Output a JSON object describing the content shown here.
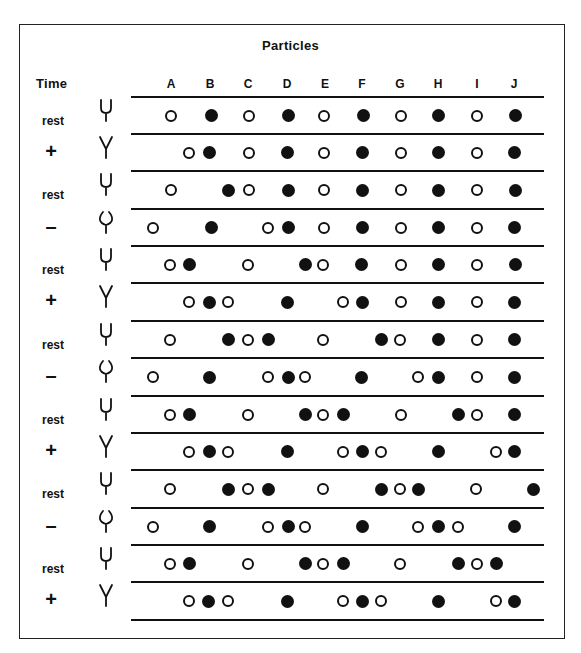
{
  "title": "Particles",
  "time_header": "Time",
  "columns": [
    "A",
    "B",
    "C",
    "D",
    "E",
    "F",
    "G",
    "H",
    "I",
    "J"
  ],
  "column_x": [
    171,
    210,
    248,
    287,
    325,
    362,
    400,
    438,
    477,
    514
  ],
  "line_y": [
    97,
    134,
    171,
    209,
    246,
    283,
    321,
    358,
    396,
    433,
    470,
    508,
    545,
    582,
    620
  ],
  "rows": [
    {
      "label": "rest",
      "fork": "rest",
      "dots": [
        [
          171,
          "o"
        ],
        [
          211,
          "f"
        ],
        [
          249,
          "o"
        ],
        [
          288,
          "f"
        ],
        [
          324,
          "o"
        ],
        [
          363,
          "f"
        ],
        [
          401,
          "o"
        ],
        [
          438,
          "f"
        ],
        [
          477,
          "o"
        ],
        [
          515,
          "f"
        ]
      ]
    },
    {
      "label": "+",
      "fork": "plus",
      "dots": [
        [
          189,
          "o"
        ],
        [
          209,
          "f"
        ],
        [
          249,
          "o"
        ],
        [
          287,
          "f"
        ],
        [
          324,
          "o"
        ],
        [
          362,
          "f"
        ],
        [
          401,
          "o"
        ],
        [
          438,
          "f"
        ],
        [
          477,
          "o"
        ],
        [
          514,
          "f"
        ]
      ]
    },
    {
      "label": "rest",
      "fork": "rest",
      "dots": [
        [
          171,
          "o"
        ],
        [
          228,
          "f"
        ],
        [
          249,
          "o"
        ],
        [
          288,
          "f"
        ],
        [
          324,
          "o"
        ],
        [
          362,
          "f"
        ],
        [
          401,
          "o"
        ],
        [
          438,
          "f"
        ],
        [
          477,
          "o"
        ],
        [
          515,
          "f"
        ]
      ]
    },
    {
      "label": "–",
      "fork": "minus",
      "dots": [
        [
          153,
          "o"
        ],
        [
          211,
          "f"
        ],
        [
          268,
          "o"
        ],
        [
          288,
          "f"
        ],
        [
          324,
          "o"
        ],
        [
          362,
          "f"
        ],
        [
          401,
          "o"
        ],
        [
          438,
          "f"
        ],
        [
          477,
          "o"
        ],
        [
          514,
          "f"
        ]
      ]
    },
    {
      "label": "rest",
      "fork": "rest",
      "dots": [
        [
          170,
          "o"
        ],
        [
          189,
          "f"
        ],
        [
          248,
          "o"
        ],
        [
          305,
          "f"
        ],
        [
          323,
          "o"
        ],
        [
          361,
          "f"
        ],
        [
          401,
          "o"
        ],
        [
          438,
          "f"
        ],
        [
          477,
          "o"
        ],
        [
          515,
          "f"
        ]
      ]
    },
    {
      "label": "+",
      "fork": "plus",
      "dots": [
        [
          189,
          "o"
        ],
        [
          209,
          "f"
        ],
        [
          228,
          "o"
        ],
        [
          287,
          "f"
        ],
        [
          343,
          "o"
        ],
        [
          362,
          "f"
        ],
        [
          401,
          "o"
        ],
        [
          438,
          "f"
        ],
        [
          477,
          "o"
        ],
        [
          514,
          "f"
        ]
      ]
    },
    {
      "label": "rest",
      "fork": "rest",
      "dots": [
        [
          170,
          "o"
        ],
        [
          228,
          "f"
        ],
        [
          248,
          "o"
        ],
        [
          268,
          "f"
        ],
        [
          323,
          "o"
        ],
        [
          381,
          "f"
        ],
        [
          400,
          "o"
        ],
        [
          438,
          "f"
        ],
        [
          477,
          "o"
        ],
        [
          514,
          "f"
        ]
      ]
    },
    {
      "label": "–",
      "fork": "minus",
      "dots": [
        [
          153,
          "o"
        ],
        [
          209,
          "f"
        ],
        [
          268,
          "o"
        ],
        [
          288,
          "f"
        ],
        [
          305,
          "o"
        ],
        [
          361,
          "f"
        ],
        [
          418,
          "o"
        ],
        [
          438,
          "f"
        ],
        [
          477,
          "o"
        ],
        [
          514,
          "f"
        ]
      ]
    },
    {
      "label": "rest",
      "fork": "rest",
      "dots": [
        [
          170,
          "o"
        ],
        [
          189,
          "f"
        ],
        [
          248,
          "o"
        ],
        [
          305,
          "f"
        ],
        [
          323,
          "o"
        ],
        [
          343,
          "f"
        ],
        [
          401,
          "o"
        ],
        [
          458,
          "f"
        ],
        [
          477,
          "o"
        ],
        [
          514,
          "f"
        ]
      ]
    },
    {
      "label": "+",
      "fork": "plus",
      "dots": [
        [
          189,
          "o"
        ],
        [
          209,
          "f"
        ],
        [
          228,
          "o"
        ],
        [
          287,
          "f"
        ],
        [
          343,
          "o"
        ],
        [
          362,
          "f"
        ],
        [
          381,
          "o"
        ],
        [
          438,
          "f"
        ],
        [
          496,
          "o"
        ],
        [
          514,
          "f"
        ]
      ]
    },
    {
      "label": "rest",
      "fork": "rest",
      "dots": [
        [
          170,
          "o"
        ],
        [
          228,
          "f"
        ],
        [
          248,
          "o"
        ],
        [
          268,
          "f"
        ],
        [
          323,
          "o"
        ],
        [
          381,
          "f"
        ],
        [
          400,
          "o"
        ],
        [
          418,
          "f"
        ],
        [
          476,
          "o"
        ],
        [
          533,
          "f"
        ]
      ]
    },
    {
      "label": "–",
      "fork": "minus",
      "dots": [
        [
          153,
          "o"
        ],
        [
          209,
          "f"
        ],
        [
          268,
          "o"
        ],
        [
          288,
          "f"
        ],
        [
          305,
          "o"
        ],
        [
          362,
          "f"
        ],
        [
          418,
          "o"
        ],
        [
          438,
          "f"
        ],
        [
          458,
          "o"
        ],
        [
          514,
          "f"
        ]
      ]
    },
    {
      "label": "rest",
      "fork": "rest",
      "dots": [
        [
          170,
          "o"
        ],
        [
          189,
          "f"
        ],
        [
          248,
          "o"
        ],
        [
          305,
          "f"
        ],
        [
          323,
          "o"
        ],
        [
          343,
          "f"
        ],
        [
          400,
          "o"
        ],
        [
          458,
          "f"
        ],
        [
          477,
          "o"
        ],
        [
          496,
          "f"
        ]
      ]
    },
    {
      "label": "+",
      "fork": "plus",
      "dots": [
        [
          189,
          "o"
        ],
        [
          208,
          "f"
        ],
        [
          228,
          "o"
        ],
        [
          287,
          "f"
        ],
        [
          343,
          "o"
        ],
        [
          362,
          "f"
        ],
        [
          381,
          "o"
        ],
        [
          438,
          "f"
        ],
        [
          496,
          "o"
        ],
        [
          514,
          "f"
        ]
      ]
    }
  ],
  "legend": {
    "open": "open circle particle",
    "filled": "filled circle particle"
  }
}
